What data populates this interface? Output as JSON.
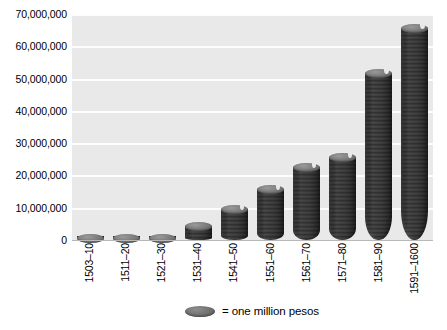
{
  "chart_data": {
    "type": "bar",
    "title": "",
    "subtitle": "",
    "xlabel": "",
    "ylabel": "",
    "categories": [
      "1503–10",
      "1511–20",
      "1521–30",
      "1531–40",
      "1541–50",
      "1551–60",
      "1561–70",
      "1571–80",
      "1581–90",
      "1591–1600"
    ],
    "values": [
      1500000,
      2000000,
      1500000,
      5500000,
      11000000,
      17000000,
      24000000,
      27000000,
      53000000,
      67000000
    ],
    "series": [
      {
        "name": "= one million pesos",
        "values": [
          1500000,
          2000000,
          1500000,
          5500000,
          11000000,
          17000000,
          24000000,
          27000000,
          53000000,
          67000000
        ]
      }
    ],
    "ylim": [
      0,
      70000000
    ],
    "ytick_values": [
      0,
      10000000,
      20000000,
      30000000,
      40000000,
      50000000,
      60000000,
      70000000
    ],
    "ytick_labels": [
      "0",
      "10,000,000",
      "20,000,000",
      "30,000,000",
      "40,000,000",
      "50,000,000",
      "60,000,000",
      "70,000,000"
    ],
    "grid": true,
    "legend_position": "bottom",
    "marker_style": "stacked-coin-disc",
    "colors": {
      "plot_background": "#e9e9e9",
      "gridline": "#fdfdfd",
      "coin_fill": "#767676",
      "coin_edge": "#545454",
      "page_background": "#ffffff",
      "text": "#000000"
    }
  },
  "legend": {
    "icon": "coin-disc-icon",
    "label": "= one million pesos"
  }
}
